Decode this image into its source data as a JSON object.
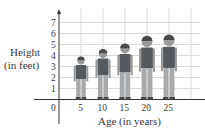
{
  "chart_data": {
    "type": "bar",
    "style": "pictograph (human figures as bars)",
    "title": "",
    "xlabel": "Age (in years)",
    "ylabel": "Height (in feet)",
    "ylabel_lines": [
      "Height",
      "(in feet)"
    ],
    "categories": [
      "5",
      "10",
      "15",
      "20",
      "25"
    ],
    "values": [
      3.9,
      4.6,
      5.1,
      5.8,
      5.9
    ],
    "x_ticks": [
      "0",
      "5",
      "10",
      "15",
      "20",
      "25"
    ],
    "y_ticks": [
      "1",
      "2",
      "3",
      "4",
      "5",
      "6",
      "7"
    ],
    "ylim": [
      0,
      7.5
    ],
    "xlim": [
      0,
      30
    ],
    "grid": true,
    "legend": null
  },
  "colors": {
    "grid": "#d9d9d9",
    "axis": "#333333",
    "shirt": "#555a5e",
    "pants": "#a7a9ab",
    "skin": "#9a9a9a",
    "hair": "#4a4a4a"
  }
}
